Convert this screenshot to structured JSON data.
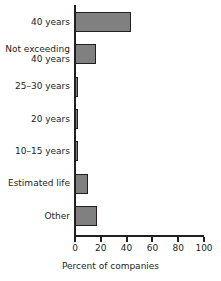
{
  "chart_data": {
    "type": "bar",
    "orientation": "horizontal",
    "title": "",
    "xlabel": "Percent of companies",
    "ylabel": "",
    "xlim": [
      0,
      100
    ],
    "xticks": [
      0,
      20,
      40,
      60,
      80,
      100
    ],
    "grid": false,
    "legend": false,
    "bar_color": "#808080",
    "bar_edge_color": "#231f20",
    "categories": [
      "40 years",
      "Not exceeding 40 years",
      "25–30 years",
      "20 years",
      "10–15 years",
      "Estimated life",
      "Other"
    ],
    "category_lines": [
      [
        "40 years"
      ],
      [
        "Not exceeding",
        "40 years"
      ],
      [
        "25–30 years"
      ],
      [
        "20 years"
      ],
      [
        "10–15 years"
      ],
      [
        "Estimated life"
      ],
      [
        "Other"
      ]
    ],
    "values": [
      44,
      17,
      3,
      3,
      3,
      11,
      18
    ]
  }
}
